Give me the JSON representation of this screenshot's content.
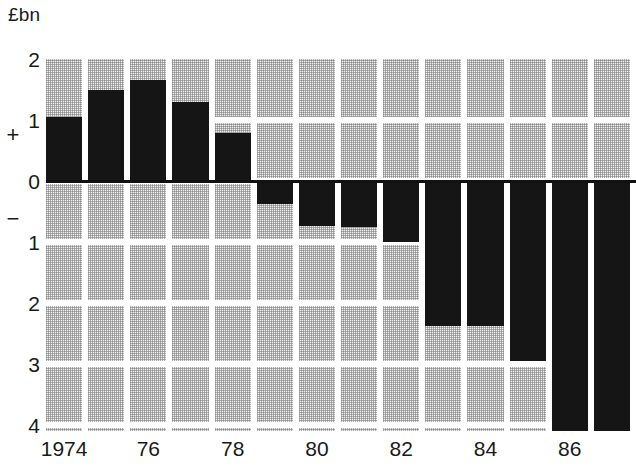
{
  "axis_unit_label": "£bn",
  "sign_positive": "+",
  "sign_negative": "−",
  "yticks": [
    {
      "label": "2",
      "value": 2
    },
    {
      "label": "1",
      "value": 1
    },
    {
      "label": "0",
      "value": 0
    },
    {
      "label": "1",
      "value": -1
    },
    {
      "label": "2",
      "value": -2
    },
    {
      "label": "3",
      "value": -3
    },
    {
      "label": "4",
      "value": -4
    }
  ],
  "xticks": [
    {
      "label": "1974",
      "index": 0
    },
    {
      "label": "76",
      "index": 2
    },
    {
      "label": "78",
      "index": 4
    },
    {
      "label": "80",
      "index": 6
    },
    {
      "label": "82",
      "index": 8
    },
    {
      "label": "84",
      "index": 10
    },
    {
      "label": "86",
      "index": 12
    }
  ],
  "colors": {
    "bar": "#151515",
    "grid_fill": "#efefef",
    "grid_dot": "#787878",
    "axis": "#111111",
    "background": "#ffffff"
  },
  "chart_data": {
    "type": "bar",
    "title": "",
    "subtitle": "",
    "xlabel": "",
    "ylabel": "£bn",
    "ylim": [
      -4.3,
      2.0
    ],
    "yticks": [
      2,
      1,
      0,
      -1,
      -2,
      -3,
      -4
    ],
    "ytick_labels": [
      "2",
      "1",
      "0",
      "1",
      "2",
      "3",
      "4"
    ],
    "y_axis_note": "Magnitude labels; '+' marks the positive half, '−' marks the negative half",
    "grid": true,
    "grid_style": "dotted-block shading per cell",
    "legend": null,
    "orientation": "vertical",
    "baseline": 0,
    "categories": [
      "1974",
      "1975",
      "1976",
      "1977",
      "1978",
      "1979",
      "1980",
      "1981",
      "1982",
      "1983",
      "1984",
      "1985",
      "1986",
      "1987"
    ],
    "xtick_labels_shown": [
      "1974",
      "",
      "76",
      "",
      "78",
      "",
      "80",
      "",
      "82",
      "",
      "84",
      "",
      "86",
      ""
    ],
    "values": [
      1.05,
      1.5,
      1.65,
      1.3,
      0.78,
      -0.37,
      -0.73,
      -0.75,
      -1.0,
      -2.37,
      -2.38,
      -2.95,
      -4.3,
      -4.3
    ],
    "clipped_at_bottom": [
      "1986",
      "1987"
    ]
  }
}
